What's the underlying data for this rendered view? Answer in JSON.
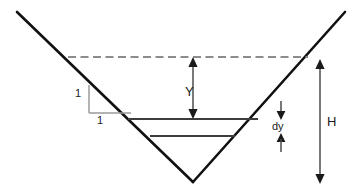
{
  "figure": {
    "background_color": "#ffffff",
    "width": 362,
    "height": 195,
    "labels": {
      "depth_Y": "Y",
      "total_depth_H": "H",
      "element_dy": "dy",
      "side_slope_vertical": "1",
      "side_slope_horizontal": "1"
    },
    "colors": {
      "channel_wall": "#111111",
      "water_surface_dashed": "#8c8c8c",
      "water_level_line": "#444444",
      "dimension_arrow": "#4d4d4d",
      "slope_triangle": "#9a9a9a",
      "text": "#1a1a1a"
    },
    "geometry": {
      "vertex": {
        "x": 193,
        "y": 182
      },
      "left_arm_top": {
        "x": 17,
        "y": 12
      },
      "right_arm_top": {
        "x": 345,
        "y": 12
      },
      "top_water_surface_y": 57,
      "upper_level_line_y": 119,
      "lower_level_line_y": 136,
      "H_arrow_x": 320,
      "Y_arrow_x": 193,
      "dy_arrow_x": 281
    }
  }
}
